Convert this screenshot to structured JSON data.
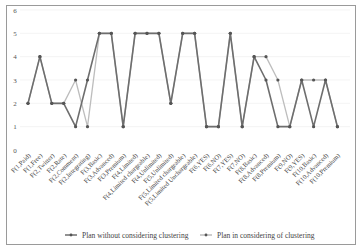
{
  "chart_data": {
    "type": "line",
    "title": "",
    "xlabel": "",
    "ylabel": "",
    "ylim": [
      0,
      6
    ],
    "yticks": [
      0,
      1,
      2,
      3,
      4,
      5,
      6
    ],
    "grid": true,
    "legend_position": "bottom",
    "categories": [
      "F(1,Paid)",
      "F(1,Free)",
      "F(2,Twitter)",
      "F(2,Rate)",
      "F(2,Comment)",
      "F(2,Integrating)",
      "F(3,Basic)",
      "F(3,Advanced)",
      "F(3,Premium)",
      "F(4,Limited)",
      "F(4,Limited chargeable)",
      "F(4,Unlimited)",
      "F(5,Unlimited)",
      "F(5,Limited chargeable)",
      "F(5,Limited Unchargeable)",
      "F(6,YES)",
      "F(6,NO)",
      "F(7,YES)",
      "F(7,NO)",
      "F(8,Basic)",
      "F(8,Advanced)",
      "F(8,Premium)",
      "F(9,NO)",
      "F(9,YES)",
      "F(10,Basic)",
      "F(10,Advanced)",
      "F(10,Premium)"
    ],
    "series": [
      {
        "name": "Plan without considering clustering",
        "color": "#6e6e6e",
        "values": [
          2,
          4,
          2,
          2,
          1,
          3,
          5,
          5,
          1,
          5,
          5,
          5,
          2,
          5,
          5,
          1,
          1,
          5,
          1,
          4,
          3,
          1,
          1,
          3,
          1,
          3,
          1
        ]
      },
      {
        "name": "Plan in considering of clustering",
        "color": "#bdbdbd",
        "values": [
          2,
          4,
          2,
          2,
          3,
          1,
          5,
          5,
          1,
          5,
          5,
          5,
          2,
          5,
          5,
          1,
          1,
          5,
          1,
          4,
          4,
          3,
          1,
          3,
          3,
          3,
          1
        ]
      }
    ]
  },
  "legend": {
    "items": [
      {
        "label": "Plan without considering clustering"
      },
      {
        "label": "Plan in considering of clustering"
      }
    ]
  }
}
